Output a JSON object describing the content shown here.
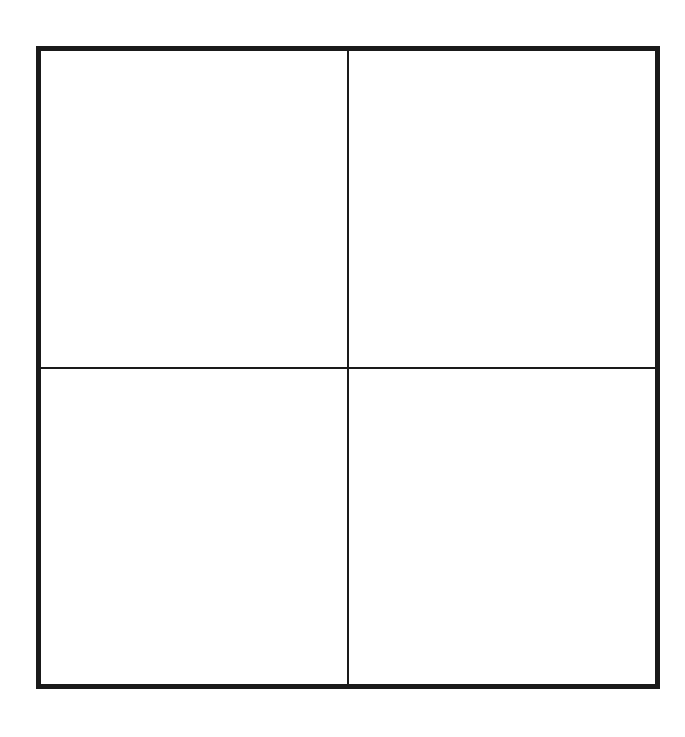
{
  "diagram": {
    "type": "2x2 grid",
    "rows": 2,
    "columns": 2,
    "cells": [
      {
        "position": "top-left",
        "label": ""
      },
      {
        "position": "top-right",
        "label": ""
      },
      {
        "position": "bottom-left",
        "label": ""
      },
      {
        "position": "bottom-right",
        "label": ""
      }
    ],
    "colors": {
      "line": "#1a1a1a",
      "background": "#ffffff"
    }
  }
}
